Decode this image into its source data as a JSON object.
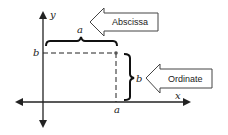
{
  "diagram": {
    "axes": {
      "x_label": "x",
      "y_label": "y"
    },
    "point": {
      "x_label": "a",
      "y_label": "b"
    },
    "braces": {
      "horizontal_label": "a",
      "vertical_label": "b"
    },
    "callouts": {
      "abscissa": "Abscissa",
      "ordinate": "Ordinate"
    },
    "colors": {
      "line": "#222222",
      "background": "#ffffff"
    }
  }
}
